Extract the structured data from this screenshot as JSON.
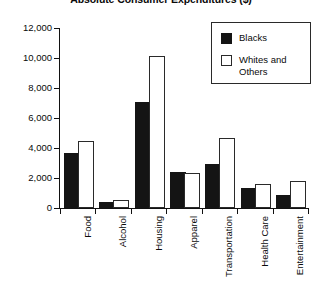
{
  "chart_data": {
    "type": "bar",
    "title": "Absolute Consumer Expenditures ($)",
    "xlabel": "",
    "ylabel": "",
    "ylim": [
      0,
      12000
    ],
    "ytick_labels": [
      "0",
      "2,000",
      "4,000",
      "6,000",
      "8,000",
      "10,000",
      "12,000"
    ],
    "ytick_values": [
      0,
      2000,
      4000,
      6000,
      8000,
      10000,
      12000
    ],
    "grid": false,
    "legend_position": "top-right",
    "categories": [
      "Food",
      "Alcohol",
      "Housing",
      "Apparel",
      "Transportation",
      "Health Care",
      "Entertainment"
    ],
    "series": [
      {
        "name": "Blacks",
        "color": "#141414",
        "values": [
          3530,
          270,
          6930,
          2270,
          2800,
          1200,
          730
        ]
      },
      {
        "name": "Whites and Others",
        "color": "#ffffff",
        "values": [
          4330,
          400,
          10000,
          2200,
          4530,
          1470,
          1670
        ]
      }
    ]
  },
  "legend": {
    "entries": [
      {
        "label": "Blacks",
        "swatch": "filled-black-square"
      },
      {
        "label": "Whites and Others",
        "swatch": "outlined-white-square"
      }
    ]
  },
  "axes": {
    "y_tick_0": "0",
    "y_tick_1": "2,000",
    "y_tick_2": "4,000",
    "y_tick_3": "6,000",
    "y_tick_4": "8,000",
    "y_tick_5": "10,000",
    "y_tick_6": "12,000"
  },
  "colors": {
    "series_blacks": "#141414",
    "series_whites": "#ffffff",
    "axis": "#111111",
    "background": "#ffffff",
    "text": "#0a0a0a"
  }
}
